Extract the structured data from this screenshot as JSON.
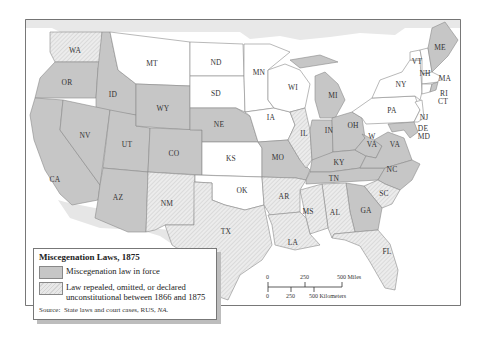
{
  "map": {
    "title": "Miscegenation Laws, 1875",
    "colors": {
      "in_force": "#c6c6c6",
      "repealed": "#e6e6e6",
      "no_law": "#ffffff",
      "water": "#e9e9e9",
      "border": "#8a8a8a"
    },
    "states": {
      "WA": "repealed",
      "OR": "in_force",
      "ID": "in_force",
      "MT": "no_law",
      "ND": "no_law",
      "SD": "no_law",
      "MN": "no_law",
      "WI": "no_law",
      "WY": "in_force",
      "NE": "in_force",
      "IA": "no_law",
      "MI": "in_force",
      "NY": "no_law",
      "VT": "no_law",
      "NH": "no_law",
      "ME": "in_force",
      "MA": "no_law",
      "RI": "in_force",
      "CT": "no_law",
      "PA": "no_law",
      "NJ": "no_law",
      "DE": "in_force",
      "MD": "in_force",
      "CA": "in_force",
      "NV": "in_force",
      "UT": "in_force",
      "CO": "in_force",
      "KS": "no_law",
      "MO": "in_force",
      "IL": "repealed",
      "IN": "in_force",
      "OH": "in_force",
      "WV": "in_force",
      "VA": "in_force",
      "KY": "in_force",
      "NC": "in_force",
      "TN": "in_force",
      "AZ": "in_force",
      "NM": "repealed",
      "OK": "no_law",
      "AR": "repealed",
      "SC": "repealed",
      "TX": "repealed",
      "MS": "repealed",
      "AL": "repealed",
      "GA": "in_force",
      "LA": "repealed",
      "FL": "repealed"
    },
    "labels": {
      "WA": "WA",
      "OR": "OR",
      "ID": "ID",
      "MT": "MT",
      "ND": "ND",
      "SD": "SD",
      "MN": "MN",
      "WI": "WI",
      "WY": "WY",
      "NE": "NE",
      "IA": "IA",
      "MI": "MI",
      "NY": "NY",
      "VT": "VT",
      "NH": "NH",
      "ME": "ME",
      "MA": "MA",
      "RI": "RI",
      "CT": "CT",
      "PA": "PA",
      "NJ": "NJ",
      "DE": "DE",
      "MD": "MD",
      "CA": "CA",
      "NV": "NV",
      "UT": "UT",
      "CO": "CO",
      "KS": "KS",
      "MO": "MO",
      "IL": "IL",
      "IN": "IN",
      "OH": "OH",
      "W": "W",
      "WVA": "VA",
      "VA": "VA",
      "KY": "KY",
      "NC": "NC",
      "TN": "TN",
      "AZ": "AZ",
      "NM": "NM",
      "OK": "OK",
      "AR": "AR",
      "SC": "SC",
      "TX": "TX",
      "MS": "MS",
      "AL": "AL",
      "GA": "GA",
      "LA": "LA",
      "FL": "FL"
    }
  },
  "legend": {
    "title": "Miscegenation Laws, 1875",
    "items": [
      {
        "swatch": "in_force",
        "label": "Miscegenation law in force"
      },
      {
        "swatch": "repealed",
        "label_line1": "Law repealed, omitted, or declared",
        "label_line2": "unconstitutional between 1866 and 1875"
      }
    ],
    "source_prefix": "Source:",
    "source_text": "State laws and court cases, RUS,",
    "source_italic": "NA."
  },
  "scale_bar": {
    "miles": {
      "ticks": [
        "0",
        "250",
        "500 Miles"
      ]
    },
    "kilometers": {
      "ticks": [
        "0",
        "250",
        "500 Kilometers"
      ]
    }
  }
}
